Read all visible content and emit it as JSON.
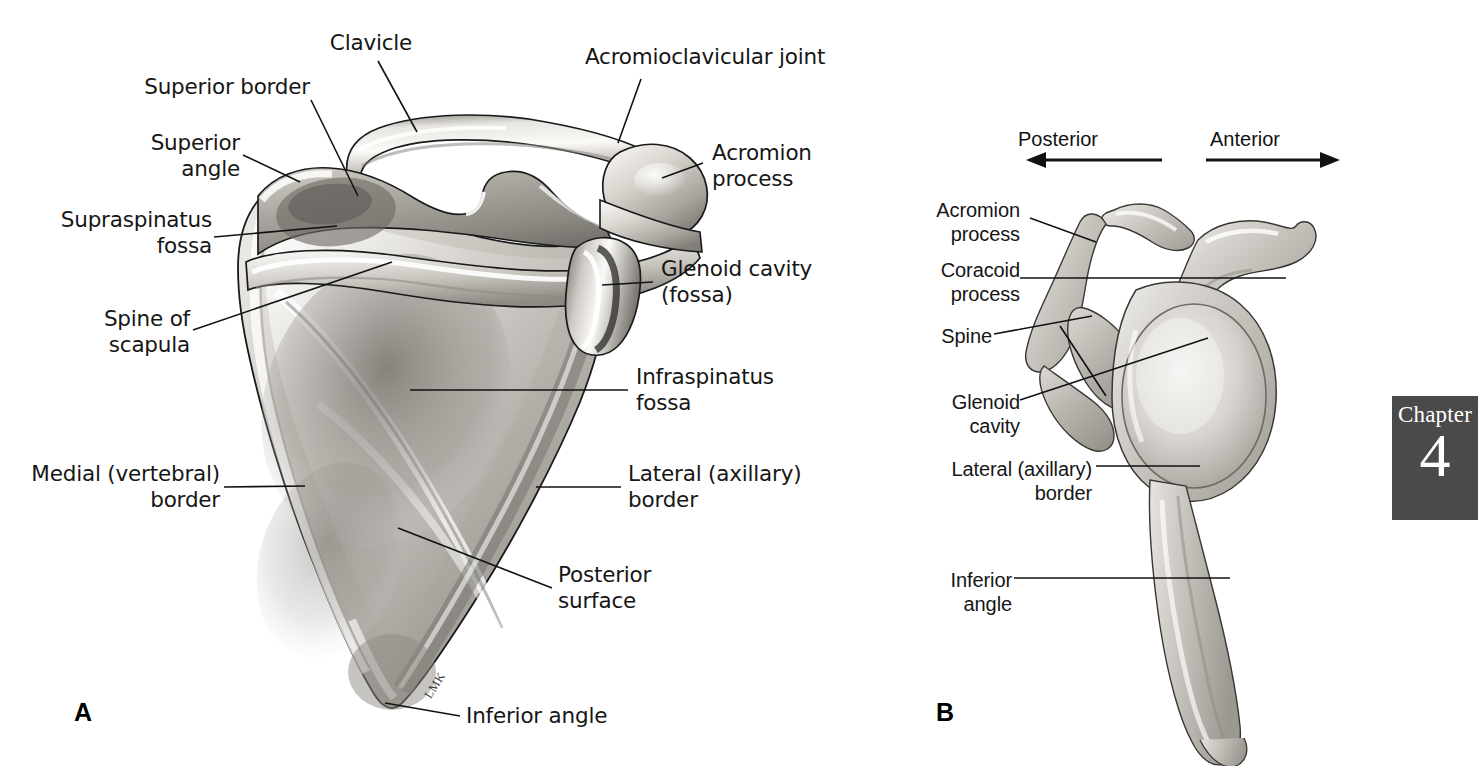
{
  "figure": {
    "background": "#ffffff",
    "ink": "#161616"
  },
  "panel_a": {
    "letter": "A",
    "view": "posterior view of right scapula with clavicle",
    "signature": "LMK",
    "labels": [
      {
        "id": "clavicle",
        "text": "Clavicle"
      },
      {
        "id": "acromioclavicular",
        "text": "Acromioclavicular joint"
      },
      {
        "id": "superior-border",
        "text": "Superior border"
      },
      {
        "id": "superior-angle",
        "text": "Superior\nangle"
      },
      {
        "id": "supraspinatus-fossa",
        "text": "Supraspinatus\nfossa"
      },
      {
        "id": "acromion-process",
        "text": "Acromion\nprocess"
      },
      {
        "id": "glenoid-cavity",
        "text": "Glenoid cavity\n(fossa)"
      },
      {
        "id": "spine-of-scapula",
        "text": "Spine of\nscapula"
      },
      {
        "id": "infraspinatus-fossa",
        "text": "Infraspinatus\nfossa"
      },
      {
        "id": "medial-border",
        "text": "Medial (vertebral)\nborder"
      },
      {
        "id": "lateral-border",
        "text": "Lateral (axillary)\nborder"
      },
      {
        "id": "posterior-surface",
        "text": "Posterior\nsurface"
      },
      {
        "id": "inferior-angle",
        "text": "Inferior angle"
      }
    ]
  },
  "panel_b": {
    "letter": "B",
    "view": "lateral view of right scapula",
    "orientation": {
      "posterior": "Posterior",
      "anterior": "Anterior"
    },
    "labels": [
      {
        "id": "acromion-process-b",
        "text": "Acromion\nprocess"
      },
      {
        "id": "coracoid-process-b",
        "text": "Coracoid\nprocess"
      },
      {
        "id": "spine-b",
        "text": "Spine"
      },
      {
        "id": "glenoid-cavity-b",
        "text": "Glenoid\ncavity"
      },
      {
        "id": "lateral-border-b",
        "text": "Lateral (axillary)\nborder"
      },
      {
        "id": "inferior-angle-b",
        "text": "Inferior\nangle"
      }
    ]
  },
  "chapter_tab": {
    "word": "Chapter",
    "number": "4",
    "background": "#4a4a4a",
    "text_color": "#ffffff"
  }
}
